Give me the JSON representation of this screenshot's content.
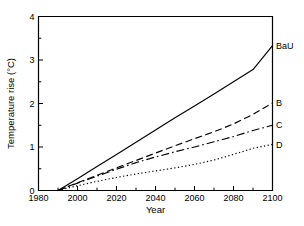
{
  "chart_data": {
    "type": "line",
    "title": "",
    "xlabel": "Year",
    "ylabel": "Temperature rise (°C)",
    "xlim": [
      1980,
      2100
    ],
    "ylim": [
      0,
      4
    ],
    "xticks": [
      1980,
      2000,
      2020,
      2040,
      2060,
      2080,
      2100
    ],
    "xtick_labels": [
      "1980",
      "2000",
      "2020",
      "2040",
      "2060",
      "2080",
      "2100"
    ],
    "xminor_ticks": [
      1990,
      2010,
      2030,
      2050,
      2070,
      2090
    ],
    "yticks": [
      0,
      1,
      2,
      3,
      4
    ],
    "ytick_labels": [
      "0",
      "1",
      "2",
      "3",
      "4"
    ],
    "yminor_ticks": [
      0.5,
      1.5,
      2.5,
      3.5
    ],
    "grid": false,
    "legend_position": "right-of-line-ends",
    "tick_direction": "in",
    "x": [
      1990,
      2000,
      2010,
      2020,
      2030,
      2040,
      2050,
      2060,
      2070,
      2080,
      2090,
      2100
    ],
    "series": [
      {
        "name": "BaU",
        "label": "BaU",
        "linestyle": "solid",
        "color": "#000000",
        "values": [
          0.0,
          0.27,
          0.55,
          0.83,
          1.11,
          1.39,
          1.67,
          1.94,
          2.22,
          2.5,
          2.78,
          3.33
        ]
      },
      {
        "name": "B",
        "label": "B",
        "linestyle": "dashed",
        "color": "#000000",
        "values": [
          0.0,
          0.18,
          0.35,
          0.52,
          0.69,
          0.86,
          1.03,
          1.19,
          1.35,
          1.53,
          1.75,
          2.01
        ]
      },
      {
        "name": "C",
        "label": "C",
        "linestyle": "dashdot",
        "color": "#000000",
        "values": [
          0.0,
          0.17,
          0.33,
          0.49,
          0.64,
          0.77,
          0.89,
          1.0,
          1.12,
          1.24,
          1.38,
          1.5
        ]
      },
      {
        "name": "D",
        "label": "D",
        "linestyle": "dotted",
        "color": "#000000",
        "values": [
          0.0,
          0.11,
          0.21,
          0.3,
          0.38,
          0.45,
          0.52,
          0.6,
          0.7,
          0.83,
          0.97,
          1.06
        ]
      }
    ]
  }
}
